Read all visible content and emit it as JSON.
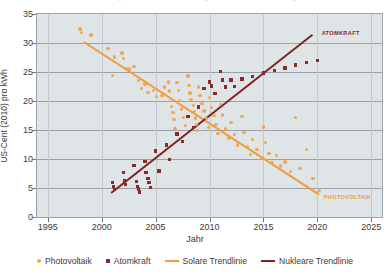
{
  "chart_data": {
    "type": "scatter",
    "title": "",
    "xlabel": "Jahr",
    "ylabel": "US-Cent (2010) pro kWh",
    "xlim": [
      1994,
      2026
    ],
    "ylim": [
      0,
      35
    ],
    "xticks": [
      1995,
      2000,
      2005,
      2010,
      2015,
      2020,
      2025
    ],
    "yticks": [
      0,
      5,
      10,
      15,
      20,
      25,
      30,
      35
    ],
    "grid": "horizontal",
    "legend_position": "bottom",
    "colors": {
      "photovoltaik": "#f3a64b",
      "atomkraft": "#8c2a2a",
      "solare_trendlinie": "#ef9b3e",
      "nukleare_trendlinie": "#7e2222",
      "plot_background": "#dfe4e7",
      "grid": "#9aa3ab"
    },
    "annotations": [
      {
        "text": "ATOMKRAFT",
        "x": 2020.4,
        "y": 31.6,
        "color": "#8c2a2a"
      },
      {
        "text": "PHOTOVOLTAIK",
        "x": 2020.6,
        "y": 3.2,
        "color": "#ef9b3e"
      }
    ],
    "series": [
      {
        "name": "Photovoltaik",
        "marker": "circle",
        "color": "#f3a64b",
        "points": [
          [
            1998.0,
            32.4
          ],
          [
            1998.1,
            31.8
          ],
          [
            1999.0,
            31.4
          ],
          [
            1999.6,
            28.7
          ],
          [
            2000.6,
            29.1
          ],
          [
            2001.2,
            27.6
          ],
          [
            2001.9,
            28.3
          ],
          [
            2002.0,
            27.3
          ],
          [
            2001.0,
            24.4
          ],
          [
            2002.3,
            25.6
          ],
          [
            2002.6,
            25.5
          ],
          [
            2003.0,
            26.0
          ],
          [
            2003.4,
            23.5
          ],
          [
            2003.7,
            22.2
          ],
          [
            2004.0,
            22.9
          ],
          [
            2004.3,
            21.5
          ],
          [
            2004.8,
            21.8
          ],
          [
            2005.1,
            20.8
          ],
          [
            2005.6,
            21.0
          ],
          [
            2005.8,
            22.4
          ],
          [
            2006.2,
            23.3
          ],
          [
            2006.3,
            21.7
          ],
          [
            2006.4,
            20.4
          ],
          [
            2006.5,
            19.1
          ],
          [
            2006.6,
            18.0
          ],
          [
            2006.7,
            16.8
          ],
          [
            2006.8,
            15.3
          ],
          [
            2007.0,
            23.2
          ],
          [
            2007.1,
            21.8
          ],
          [
            2007.2,
            20.1
          ],
          [
            2007.4,
            18.6
          ],
          [
            2007.6,
            17.2
          ],
          [
            2007.8,
            15.8
          ],
          [
            2008.0,
            24.3
          ],
          [
            2008.1,
            22.7
          ],
          [
            2008.2,
            21.4
          ],
          [
            2008.3,
            20.3
          ],
          [
            2008.5,
            19.2
          ],
          [
            2008.6,
            18.2
          ],
          [
            2008.7,
            17.1
          ],
          [
            2008.8,
            16.0
          ],
          [
            2008.9,
            14.9
          ],
          [
            2009.0,
            22.4
          ],
          [
            2009.1,
            21.0
          ],
          [
            2009.3,
            19.6
          ],
          [
            2009.5,
            18.3
          ],
          [
            2009.7,
            17.0
          ],
          [
            2009.9,
            15.4
          ],
          [
            2010.0,
            20.6
          ],
          [
            2010.2,
            18.9
          ],
          [
            2010.4,
            17.5
          ],
          [
            2010.6,
            15.9
          ],
          [
            2010.8,
            14.4
          ],
          [
            2011.0,
            19.4
          ],
          [
            2011.2,
            17.6
          ],
          [
            2011.5,
            15.2
          ],
          [
            2011.8,
            13.6
          ],
          [
            2012.0,
            16.3
          ],
          [
            2012.3,
            14.2
          ],
          [
            2012.6,
            12.4
          ],
          [
            2013.0,
            17.3
          ],
          [
            2013.2,
            14.6
          ],
          [
            2013.5,
            12.2
          ],
          [
            2013.8,
            10.8
          ],
          [
            2014.0,
            13.4
          ],
          [
            2014.4,
            11.6
          ],
          [
            2014.8,
            10.2
          ],
          [
            2015.0,
            15.5
          ],
          [
            2015.2,
            12.8
          ],
          [
            2015.5,
            11.0
          ],
          [
            2015.8,
            9.4
          ],
          [
            2016.2,
            10.6
          ],
          [
            2016.6,
            8.8
          ],
          [
            2017.0,
            9.5
          ],
          [
            2017.5,
            7.8
          ],
          [
            2018.0,
            17.2
          ],
          [
            2018.4,
            8.4
          ],
          [
            2019.0,
            11.6
          ],
          [
            2019.6,
            6.6
          ],
          [
            2020.0,
            4.2
          ],
          [
            2020.2,
            4.6
          ]
        ]
      },
      {
        "name": "Atomkraft",
        "marker": "square",
        "color": "#8c2a2a",
        "points": [
          [
            2001.0,
            5.9
          ],
          [
            2001.1,
            5.3
          ],
          [
            2001.2,
            4.7
          ],
          [
            2002.0,
            7.7
          ],
          [
            2002.1,
            6.2
          ],
          [
            2002.2,
            5.6
          ],
          [
            2003.0,
            8.9
          ],
          [
            2003.2,
            6.1
          ],
          [
            2003.3,
            5.3
          ],
          [
            2003.4,
            4.8
          ],
          [
            2003.5,
            4.3
          ],
          [
            2004.0,
            9.6
          ],
          [
            2004.1,
            7.7
          ],
          [
            2004.3,
            6.6
          ],
          [
            2004.4,
            6.0
          ],
          [
            2004.5,
            5.1
          ],
          [
            2005.0,
            11.4
          ],
          [
            2005.3,
            7.9
          ],
          [
            2006.0,
            12.4
          ],
          [
            2006.3,
            9.9
          ],
          [
            2007.0,
            14.3
          ],
          [
            2007.5,
            13.0
          ],
          [
            2008.0,
            17.3
          ],
          [
            2008.5,
            15.4
          ],
          [
            2009.0,
            19.0
          ],
          [
            2009.5,
            22.2
          ],
          [
            2010.0,
            23.3
          ],
          [
            2010.2,
            22.6
          ],
          [
            2010.5,
            21.3
          ],
          [
            2011.0,
            25.1
          ],
          [
            2011.2,
            23.6
          ],
          [
            2011.5,
            22.4
          ],
          [
            2012.0,
            23.6
          ],
          [
            2012.3,
            22.5
          ],
          [
            2013.0,
            23.8
          ],
          [
            2014.0,
            24.2
          ],
          [
            2015.0,
            24.8
          ],
          [
            2016.0,
            25.3
          ],
          [
            2017.0,
            25.7
          ],
          [
            2018.0,
            26.2
          ],
          [
            2019.0,
            26.6
          ],
          [
            2020.0,
            27.0
          ]
        ]
      }
    ],
    "trendlines": [
      {
        "name": "Solare Trendlinie",
        "color": "#ef9b3e",
        "x0": 1998.4,
        "y0": 30.4,
        "x1": 2020.2,
        "y1": 4.1
      },
      {
        "name": "Nukleare Trendlinie",
        "color": "#7e2222",
        "x0": 2000.9,
        "y0": 4.3,
        "x1": 2019.6,
        "y1": 31.6
      }
    ]
  },
  "legend": {
    "items": [
      {
        "label": "Photovoltaik",
        "swatch": "dot-orange"
      },
      {
        "label": "Atomkraft",
        "swatch": "square-darkred"
      },
      {
        "label": "Solare Trendlinie",
        "swatch": "line-orange"
      },
      {
        "label": "Nukleare Trendlinie",
        "swatch": "line-darkred"
      }
    ]
  }
}
